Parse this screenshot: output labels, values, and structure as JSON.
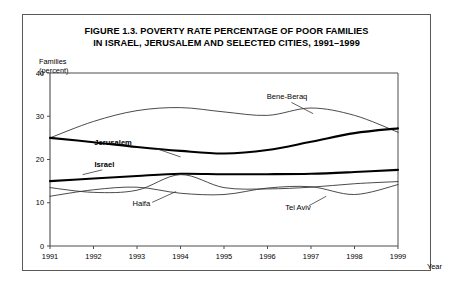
{
  "figure": {
    "title_line1": "FIGURE 1.3. POVERTY RATE  PERCENTAGE OF POOR FAMILIES",
    "title_line2": "IN ISRAEL, JERUSALEM AND SELECTED CITIES, 1991–1999",
    "y_unit_line1": "Families",
    "y_unit_line2": "(percent)",
    "x_axis_title": "Year"
  },
  "chart_data": {
    "type": "line",
    "title": "FIGURE 1.3. POVERTY RATE  PERCENTAGE OF POOR FAMILIES IN ISRAEL, JERUSALEM AND SELECTED CITIES, 1991–1999",
    "xlabel": "Year",
    "ylabel": "Families (percent)",
    "x": [
      1991,
      1992,
      1993,
      1994,
      1995,
      1996,
      1997,
      1998,
      1999
    ],
    "xlim": [
      1991,
      1999
    ],
    "ylim": [
      0,
      40
    ],
    "yticks": [
      0,
      10,
      20,
      30,
      40
    ],
    "xticks": [
      "1991",
      "1992",
      "1993",
      "1994",
      "1995",
      "1996",
      "1997",
      "1998",
      "1999"
    ],
    "grid": false,
    "legend": "inline-labels",
    "series": [
      {
        "name": "Bene-Beraq",
        "emphasis": "normal",
        "label_x": 1996.45,
        "label_y": 34.1,
        "leader": [
          [
            1996.55,
            33.2
          ],
          [
            1997.05,
            30.6
          ]
        ],
        "values": [
          25.0,
          28.8,
          31.3,
          32.0,
          31.0,
          30.2,
          31.9,
          30.2,
          26.3
        ]
      },
      {
        "name": "Jerusalem",
        "emphasis": "bold",
        "label_x": 1992.45,
        "label_y": 23.4,
        "leader": [
          [
            1993.45,
            22.5
          ],
          [
            1994.0,
            20.6
          ]
        ],
        "values": [
          25.0,
          24.0,
          22.9,
          22.0,
          21.4,
          22.2,
          24.1,
          26.1,
          27.2
        ]
      },
      {
        "name": "Israel",
        "emphasis": "bold",
        "label_x": 1992.25,
        "label_y": 18.3,
        "leader": [
          [
            1992.2,
            17.6
          ],
          [
            1991.75,
            16.5
          ]
        ],
        "values": [
          15.0,
          15.6,
          16.2,
          16.7,
          16.6,
          16.6,
          16.7,
          17.1,
          17.6
        ]
      },
      {
        "name": "Haifa",
        "emphasis": "normal",
        "label_x": 1993.1,
        "label_y": 9.3,
        "leader": [
          [
            1993.35,
            10.1
          ],
          [
            1993.9,
            12.6
          ]
        ],
        "values": [
          13.5,
          12.4,
          12.9,
          16.5,
          13.5,
          13.2,
          13.6,
          14.4,
          14.9
        ]
      },
      {
        "name": "Tel Aviv",
        "emphasis": "normal",
        "label_x": 1996.7,
        "label_y": 8.4,
        "leader": [
          [
            1996.95,
            9.3
          ],
          [
            1997.35,
            11.5
          ]
        ],
        "values": [
          11.5,
          13.0,
          13.6,
          12.2,
          11.9,
          13.4,
          13.7,
          11.9,
          14.2
        ]
      }
    ]
  }
}
